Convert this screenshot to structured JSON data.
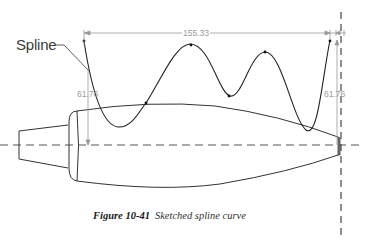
{
  "figure": {
    "number_label": "Figure 10-41",
    "caption_text": "Sketched spline curve"
  },
  "labels": {
    "spline_callout": "Spline"
  },
  "dimensions": {
    "horizontal_span": "155.33",
    "left_height": "61.76",
    "right_height": "61.76"
  },
  "colors": {
    "geometry_line": "#333333",
    "dimension_line": "#9a9a9a",
    "centerline": "#555555"
  }
}
